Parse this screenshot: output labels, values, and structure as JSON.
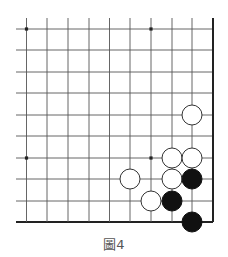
{
  "diagram": {
    "type": "go-board-fragment",
    "caption": "圖4",
    "board": {
      "columns_x": [
        26.5,
        47,
        68,
        89,
        109.5,
        130,
        151,
        172,
        192,
        213
      ],
      "rows_y": [
        29,
        50,
        72,
        93,
        115,
        136,
        158,
        179,
        201,
        222
      ],
      "line_start_x": 16,
      "line_start_y": 18,
      "right_edge": true,
      "bottom_edge": true,
      "star_points": [
        [
          0,
          0
        ],
        [
          6,
          0
        ],
        [
          0,
          6
        ],
        [
          6,
          6
        ]
      ],
      "line_color": "#555555",
      "edge_color": "#222222"
    },
    "stones": [
      {
        "color": "white",
        "col": 8,
        "row": 4
      },
      {
        "color": "white",
        "col": 7,
        "row": 6
      },
      {
        "color": "white",
        "col": 8,
        "row": 6
      },
      {
        "color": "white",
        "col": 5,
        "row": 7
      },
      {
        "color": "white",
        "col": 7,
        "row": 7
      },
      {
        "color": "white",
        "col": 6,
        "row": 8
      },
      {
        "color": "black",
        "col": 8,
        "row": 7
      },
      {
        "color": "black",
        "col": 7,
        "row": 8
      },
      {
        "color": "black",
        "col": 8,
        "row": 9
      }
    ],
    "stone_radius": 10
  }
}
